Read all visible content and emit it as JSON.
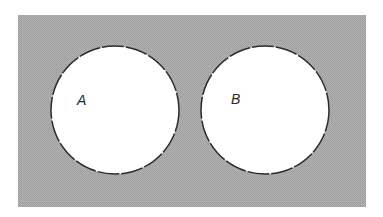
{
  "diagram": {
    "type": "venn",
    "universe": {
      "x": 18,
      "y": 15,
      "width": 348,
      "height": 192,
      "fill": "#a9a9a9"
    },
    "sets": [
      {
        "label": "A",
        "cx": 115,
        "cy": 110,
        "r": 64,
        "label_x": 77,
        "label_y": 105,
        "fill": "#ffffff",
        "stroke": "#2b2b2b"
      },
      {
        "label": "B",
        "cx": 265,
        "cy": 110,
        "r": 64,
        "label_x": 231,
        "label_y": 104,
        "fill": "#ffffff",
        "stroke": "#2b2b2b"
      }
    ],
    "relationship": "disjoint"
  }
}
